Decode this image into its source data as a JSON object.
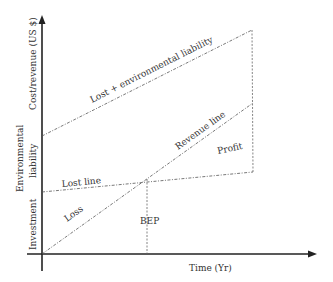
{
  "diagram": {
    "axes": {
      "x_label": "Time (Yr)",
      "y_label": "Cost/revenue (US $)",
      "y_segments": {
        "environmental_liability": [
          "Environmental",
          "liability"
        ],
        "investment": "Investment"
      }
    },
    "lines": {
      "lost_plus_env": "Lost + environmental liability",
      "revenue": "Revenue line",
      "lost": "Lost line"
    },
    "regions": {
      "loss": "Loss",
      "profit": "Profit"
    },
    "markers": {
      "bep": "BEP"
    },
    "colors": {
      "axis": "#222222",
      "line": "#555555",
      "text": "#333333"
    }
  }
}
